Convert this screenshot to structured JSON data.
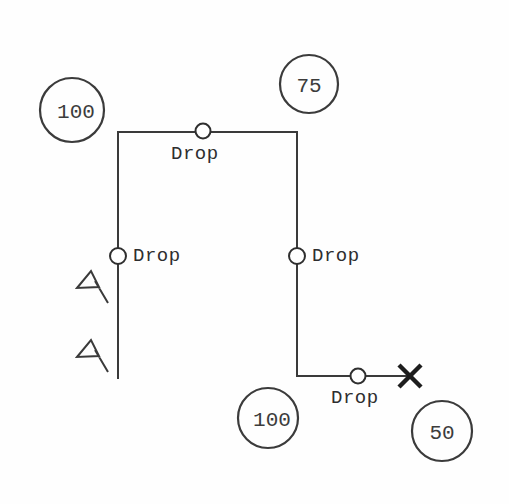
{
  "diagram": {
    "background_color": "#fefefe",
    "line_color": "#3a3a3a",
    "text_color": "#2e2e2e",
    "pipes": [
      {
        "name": "top-horizontal-main",
        "from": [
          118,
          132
        ],
        "to": [
          297,
          132
        ]
      },
      {
        "name": "left-riser",
        "from": [
          118,
          132
        ],
        "to": [
          118,
          378
        ]
      },
      {
        "name": "right-riser",
        "from": [
          297,
          132
        ],
        "to": [
          297,
          376
        ]
      },
      {
        "name": "bottom-horizontal-branch",
        "from": [
          297,
          376
        ],
        "to": [
          412,
          376
        ]
      }
    ],
    "drops": [
      {
        "id": "drop-top",
        "label": "Drop",
        "node": [
          203,
          131
        ],
        "label_x": 171,
        "label_y": 143
      },
      {
        "id": "drop-left",
        "label": "Drop",
        "node": [
          118,
          256
        ],
        "label_x": 133,
        "label_y": 245
      },
      {
        "id": "drop-right",
        "label": "Drop",
        "node": [
          297,
          256
        ],
        "label_x": 312,
        "label_y": 245
      },
      {
        "id": "drop-bottom",
        "label": "Drop",
        "node": [
          358,
          376
        ],
        "label_x": 331,
        "label_y": 387
      }
    ],
    "tags": [
      {
        "id": "tag-upper-left",
        "value": "100",
        "cx": 72,
        "cy": 110,
        "r": 32
      },
      {
        "id": "tag-upper-right",
        "value": "75",
        "cx": 309,
        "cy": 84,
        "r": 29
      },
      {
        "id": "tag-lower-middle",
        "value": "100",
        "cx": 268,
        "cy": 418,
        "r": 30
      },
      {
        "id": "tag-lower-right",
        "value": "50",
        "cx": 442,
        "cy": 431,
        "r": 30
      }
    ],
    "flags": [
      {
        "id": "flag-upper",
        "apex": [
          91,
          271
        ],
        "left": [
          77,
          288
        ],
        "right": [
          99,
          287
        ],
        "tail_end": [
          108,
          303
        ]
      },
      {
        "id": "flag-lower",
        "apex": [
          91,
          340
        ],
        "left": [
          77,
          357
        ],
        "right": [
          99,
          356
        ],
        "tail_end": [
          108,
          372
        ]
      }
    ],
    "terminator": {
      "id": "end-cap-x",
      "cx": 410,
      "cy": 376,
      "half": 11
    }
  }
}
